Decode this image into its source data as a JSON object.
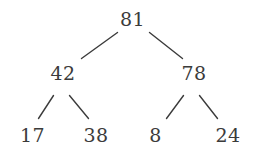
{
  "diagram": {
    "type": "binary-tree",
    "title": "",
    "background_color": "#ffffff",
    "edge_color": "#3b3b3b",
    "text_color": "#3b3b3b",
    "levels": 3,
    "nodes": {
      "root": "81",
      "left_child": "42",
      "right_child": "78",
      "left_left_leaf": "17",
      "left_right_leaf": "38",
      "right_left_leaf": "8",
      "right_right_leaf": "24"
    },
    "structure": [
      {
        "id": "root",
        "value": "81",
        "parent": null,
        "side": null,
        "depth": 0
      },
      {
        "id": "left_child",
        "value": "42",
        "parent": "root",
        "side": "left",
        "depth": 1
      },
      {
        "id": "right_child",
        "value": "78",
        "parent": "root",
        "side": "right",
        "depth": 1
      },
      {
        "id": "left_left_leaf",
        "value": "17",
        "parent": "left_child",
        "side": "left",
        "depth": 2
      },
      {
        "id": "left_right_leaf",
        "value": "38",
        "parent": "left_child",
        "side": "right",
        "depth": 2
      },
      {
        "id": "right_left_leaf",
        "value": "8",
        "parent": "right_child",
        "side": "left",
        "depth": 2
      },
      {
        "id": "right_right_leaf",
        "value": "24",
        "parent": "right_child",
        "side": "right",
        "depth": 2
      }
    ]
  }
}
